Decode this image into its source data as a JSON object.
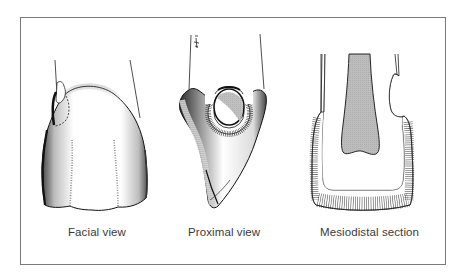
{
  "figure": {
    "panels": [
      {
        "id": "facial",
        "label": "Facial view"
      },
      {
        "id": "proximal",
        "label": "Proximal view"
      },
      {
        "id": "mesiodistal",
        "label": "Mesiodistal section"
      }
    ],
    "colors": {
      "border": "#7a7a7a",
      "ink": "#1a1a1a",
      "pulp_fill": "#b8b8b8",
      "caption": "#3a3a3a",
      "background": "#ffffff"
    }
  }
}
